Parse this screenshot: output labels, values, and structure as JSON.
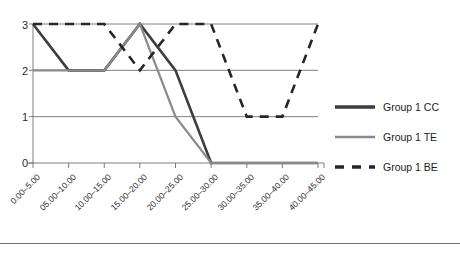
{
  "chart_data": {
    "type": "line",
    "title": "",
    "xlabel": "",
    "ylabel": "",
    "ylim": [
      0,
      3
    ],
    "yticks": [
      "0",
      "1",
      "2",
      "3"
    ],
    "grid": true,
    "legend_position": "right",
    "categories": [
      "0.00–5.00",
      "05.00–10.00",
      "10.00–15.00",
      "15.00–20.00",
      "20.00–25.00",
      "25.00–30.00",
      "30.00–35.00",
      "35.00–40.00",
      "40.00–45.00"
    ],
    "series": [
      {
        "name": "Group 1 CC",
        "color": "#3d3d3d",
        "style": "solid",
        "width": 2.6,
        "values": [
          3,
          2,
          2,
          3,
          2,
          0,
          0,
          0,
          0
        ]
      },
      {
        "name": "Group 1 TE",
        "color": "#8a8a8a",
        "style": "solid",
        "width": 2.2,
        "values": [
          2,
          2,
          2,
          3,
          1,
          0,
          0,
          0,
          0
        ]
      },
      {
        "name": "Group 1 BE",
        "color": "#262626",
        "style": "dashed",
        "width": 2.6,
        "values": [
          3,
          3,
          3,
          2,
          3,
          3,
          1,
          1,
          3
        ]
      }
    ]
  },
  "legend": {
    "items": [
      {
        "label": "Group 1 CC"
      },
      {
        "label": "Group 1 TE"
      },
      {
        "label": "Group 1 BE"
      }
    ]
  }
}
